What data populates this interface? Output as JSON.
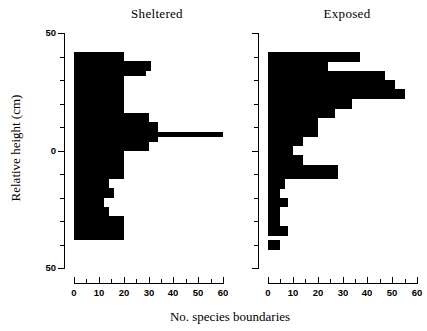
{
  "figure": {
    "xlabel": "No. species boundaries",
    "ylabel": "Relative height (cm)"
  },
  "panels": [
    {
      "key": "sheltered",
      "title": "Sheltered"
    },
    {
      "key": "exposed",
      "title": "Exposed"
    }
  ],
  "axes": {
    "y_ticklabels": [
      "50",
      "0",
      "50"
    ],
    "y_tick_values": [
      50,
      0,
      -50
    ],
    "y_minor_step": 10,
    "x_ticklabels": [
      "0",
      "10",
      "20",
      "30",
      "40",
      "50",
      "60"
    ],
    "x_tick_values": [
      0,
      10,
      20,
      30,
      40,
      50,
      60
    ],
    "x_minor_step": 5
  },
  "colors": {
    "bar": "#000000",
    "axis": "#000000",
    "background": "#ffffff"
  },
  "chart_data": {
    "type": "bar",
    "orientation": "horizontal",
    "title": "",
    "xlabel": "No. species boundaries",
    "ylabel": "Relative height (cm)",
    "xlim": [
      0,
      60
    ],
    "ylim": [
      -50,
      50
    ],
    "bin_width": 2,
    "grid": false,
    "legend": "none",
    "bin_centers": [
      41,
      39,
      37,
      35,
      33,
      31,
      29,
      27,
      25,
      23,
      21,
      19,
      17,
      15,
      13,
      11,
      9,
      7,
      5,
      3,
      1,
      -1,
      -3,
      -5,
      -7,
      -9,
      -11,
      -13,
      -15,
      -17,
      -19,
      -21,
      -23,
      -25,
      -27,
      -29,
      -31,
      -33,
      -35,
      -37,
      -39,
      -41,
      -43,
      -45
    ],
    "series": [
      {
        "name": "Sheltered",
        "values": [
          20,
          20,
          31,
          31,
          29,
          20,
          20,
          20,
          20,
          20,
          20,
          20,
          20,
          30,
          30,
          34,
          34,
          60,
          34,
          30,
          30,
          20,
          20,
          20,
          20,
          20,
          20,
          14,
          14,
          16,
          16,
          12,
          12,
          14,
          14,
          20,
          20,
          20,
          20,
          20,
          0,
          0,
          0,
          0
        ]
      },
      {
        "name": "Exposed",
        "values": [
          37,
          37,
          24,
          24,
          47,
          47,
          51,
          51,
          55,
          55,
          34,
          34,
          27,
          27,
          20,
          20,
          20,
          20,
          14,
          14,
          10,
          10,
          14,
          14,
          28,
          28,
          28,
          7,
          7,
          5,
          5,
          8,
          8,
          5,
          5,
          5,
          5,
          8,
          8,
          0,
          5,
          5,
          0,
          0
        ]
      }
    ]
  }
}
